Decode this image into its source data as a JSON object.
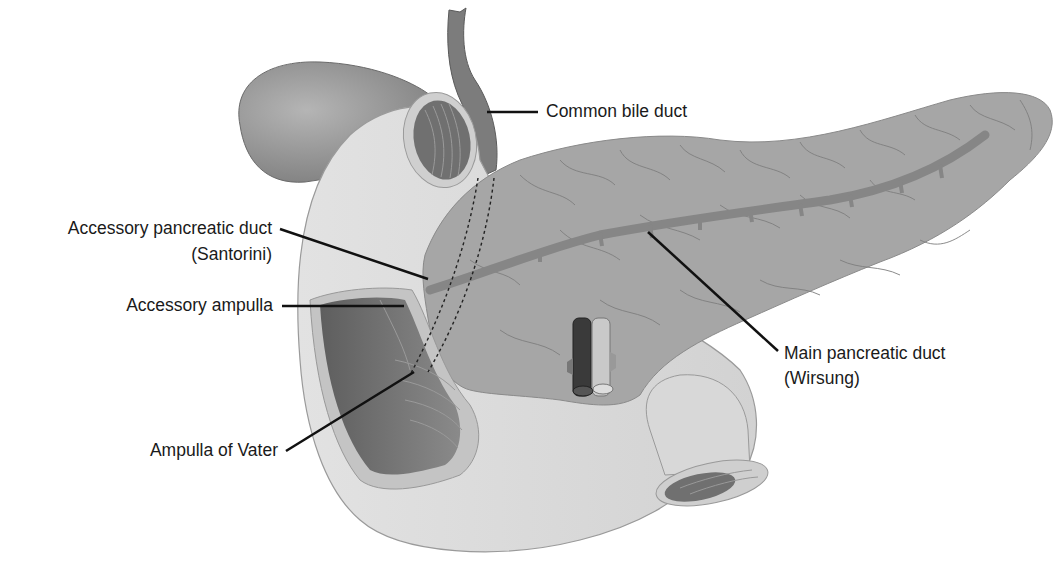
{
  "figure": {
    "colors": {
      "background": "#ffffff",
      "duodenum": "#d9d9d9",
      "duodenum_outline": "#9a9a9a",
      "duodenum_lumen": "#6f6f6f",
      "pancreas": "#a3a3a3",
      "pancreas_lobule_lines": "#7a7a7a",
      "main_duct": "#858585",
      "gallbladder": "#8a8a8a",
      "bile_duct": "#7a7a7a",
      "vessel_dark": "#3a3a3a",
      "vessel_light": "#c8c8c8",
      "leader_line": "#111111",
      "label_text": "#1a1a1a"
    }
  },
  "labels": {
    "common_bile_duct": "Common bile duct",
    "accessory_duct_line1": "Accessory pancreatic duct",
    "accessory_duct_line2": "(Santorini)",
    "accessory_ampulla": "Accessory ampulla",
    "ampulla_of_vater": "Ampulla of Vater",
    "main_duct_line1": "Main pancreatic duct",
    "main_duct_line2": "(Wirsung)"
  }
}
